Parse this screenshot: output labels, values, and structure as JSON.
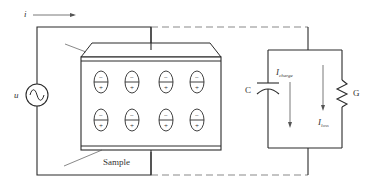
{
  "diagram": {
    "type": "circuit",
    "colors": {
      "wire": "#2a2a2a",
      "dashed_wire": "#8a8a8a",
      "text": "#333333",
      "background": "#ffffff"
    },
    "labels": {
      "current": "i",
      "source": "u",
      "capacitor": "C",
      "resistor": "G",
      "i_charge_main": "I",
      "i_charge_sub": "charge",
      "i_loss_main": "I",
      "i_loss_sub": "loss",
      "sample": "Sample"
    },
    "dipoles": {
      "rows": 2,
      "cols": 4,
      "top_sign": "−",
      "bottom_sign": "+"
    },
    "components": [
      {
        "id": "ac-source",
        "symbol": "sine-wave-source",
        "label": "u"
      },
      {
        "id": "sample",
        "symbol": "dielectric-sample-between-electrodes",
        "label": "Sample"
      },
      {
        "id": "capacitor",
        "symbol": "capacitor",
        "label": "C"
      },
      {
        "id": "resistor",
        "symbol": "resistor-zigzag",
        "label": "G"
      }
    ]
  }
}
